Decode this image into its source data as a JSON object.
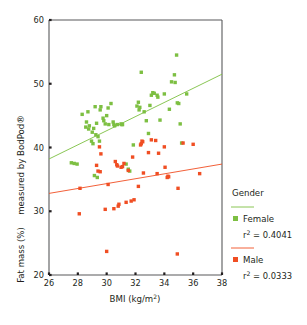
{
  "chart_data": {
    "type": "scatter",
    "title": "",
    "xlabel": "BMI (kg/m2)",
    "xlabel_base": "BMI (kg/m",
    "xlabel_sup": "2",
    "xlabel_tail": ")",
    "ylabel_line1": "measured by BodPod®",
    "ylabel_line2": "Fat mass (%)",
    "xlim": [
      26,
      38
    ],
    "ylim": [
      20,
      60
    ],
    "xticks": [
      26,
      28,
      30,
      32,
      34,
      36,
      38
    ],
    "xticklabels": [
      "26",
      "28",
      "30",
      "32",
      "34",
      "36",
      "38"
    ],
    "yticks": [
      20,
      30,
      40,
      50,
      60
    ],
    "yticklabels": [
      "20",
      "30",
      "40",
      "50",
      "60"
    ],
    "grid": false,
    "legend_position": "right",
    "colors": {
      "female": "#7DBF42",
      "male": "#F04E23",
      "axis": "#58595b",
      "text": "#231f20"
    },
    "series": [
      {
        "name": "Female",
        "color": "#7DBF42",
        "marker": "square",
        "r2": 0.4041,
        "r2_label": "r2 = 0.4041",
        "trendline": {
          "x0": 26,
          "y0": 38.2,
          "x1": 38,
          "y1": 51.5
        },
        "points": [
          [
            27.55,
            37.6
          ],
          [
            27.75,
            37.5
          ],
          [
            27.95,
            37.4
          ],
          [
            28.3,
            45.2
          ],
          [
            28.55,
            43.2
          ],
          [
            28.6,
            44.0
          ],
          [
            28.7,
            45.6
          ],
          [
            28.75,
            42.9
          ],
          [
            28.8,
            43.4
          ],
          [
            28.95,
            41.0
          ],
          [
            29.0,
            42.4
          ],
          [
            29.05,
            40.6
          ],
          [
            29.1,
            43.0
          ],
          [
            29.15,
            35.6
          ],
          [
            29.2,
            46.4
          ],
          [
            29.25,
            42.0
          ],
          [
            29.3,
            43.8
          ],
          [
            29.35,
            35.3
          ],
          [
            29.4,
            41.7
          ],
          [
            29.5,
            41.0
          ],
          [
            29.55,
            45.9
          ],
          [
            29.6,
            46.4
          ],
          [
            29.75,
            44.6
          ],
          [
            29.8,
            44.2
          ],
          [
            29.9,
            43.7
          ],
          [
            30.0,
            45.0
          ],
          [
            30.1,
            46.2
          ],
          [
            30.15,
            43.6
          ],
          [
            30.3,
            46.9
          ],
          [
            30.45,
            44.0
          ],
          [
            30.5,
            43.6
          ],
          [
            30.55,
            43.4
          ],
          [
            30.75,
            43.6
          ],
          [
            31.0,
            43.7
          ],
          [
            31.05,
            43.6
          ],
          [
            31.1,
            43.6
          ],
          [
            31.35,
            37.4
          ],
          [
            31.5,
            36.6
          ],
          [
            31.6,
            36.3
          ],
          [
            31.85,
            40.4
          ],
          [
            32.1,
            46.5
          ],
          [
            32.2,
            47.1
          ],
          [
            32.25,
            45.9
          ],
          [
            32.3,
            46.3
          ],
          [
            32.4,
            51.8
          ],
          [
            32.6,
            45.6
          ],
          [
            32.75,
            44.2
          ],
          [
            32.9,
            42.2
          ],
          [
            33.0,
            46.6
          ],
          [
            33.1,
            48.2
          ],
          [
            33.2,
            48.6
          ],
          [
            33.3,
            48.5
          ],
          [
            33.5,
            48.2
          ],
          [
            33.55,
            47.9
          ],
          [
            33.7,
            44.3
          ],
          [
            34.0,
            48.4
          ],
          [
            34.35,
            46.0
          ],
          [
            34.5,
            50.3
          ],
          [
            34.7,
            51.4
          ],
          [
            34.75,
            50.2
          ],
          [
            34.85,
            54.5
          ],
          [
            34.9,
            47.0
          ],
          [
            35.0,
            46.9
          ],
          [
            35.1,
            43.7
          ],
          [
            35.2,
            40.7
          ],
          [
            35.55,
            48.4
          ]
        ]
      },
      {
        "name": "Male",
        "color": "#F04E23",
        "marker": "square",
        "r2": 0.0333,
        "r2_label": "r2 = 0.0333",
        "trendline": {
          "x0": 26,
          "y0": 32.8,
          "x1": 38,
          "y1": 37.4
        },
        "points": [
          [
            28.1,
            29.6
          ],
          [
            28.15,
            33.6
          ],
          [
            29.3,
            37.2
          ],
          [
            29.4,
            36.3
          ],
          [
            29.5,
            40.1
          ],
          [
            29.55,
            36.2
          ],
          [
            29.6,
            39.0
          ],
          [
            29.9,
            30.3
          ],
          [
            30.0,
            23.7
          ],
          [
            30.1,
            34.2
          ],
          [
            30.5,
            30.4
          ],
          [
            30.6,
            37.8
          ],
          [
            30.7,
            37.3
          ],
          [
            30.75,
            37.1
          ],
          [
            30.8,
            30.8
          ],
          [
            30.85,
            31.1
          ],
          [
            31.0,
            36.9
          ],
          [
            31.1,
            37.0
          ],
          [
            31.2,
            37.5
          ],
          [
            31.35,
            31.4
          ],
          [
            31.5,
            36.4
          ],
          [
            31.7,
            31.6
          ],
          [
            31.8,
            38.5
          ],
          [
            31.9,
            31.8
          ],
          [
            32.2,
            33.9
          ],
          [
            32.35,
            40.4
          ],
          [
            32.4,
            40.6
          ],
          [
            32.45,
            41.0
          ],
          [
            32.5,
            40.9
          ],
          [
            32.55,
            36.0
          ],
          [
            32.9,
            39.2
          ],
          [
            33.1,
            41.2
          ],
          [
            33.4,
            41.1
          ],
          [
            33.5,
            35.9
          ],
          [
            33.6,
            39.1
          ],
          [
            34.0,
            40.1
          ],
          [
            34.05,
            36.9
          ],
          [
            34.2,
            35.3
          ],
          [
            34.25,
            35.5
          ],
          [
            34.3,
            35.4
          ],
          [
            34.9,
            23.3
          ],
          [
            34.95,
            33.6
          ],
          [
            35.3,
            40.7
          ],
          [
            36.0,
            40.5
          ],
          [
            36.45,
            35.9
          ]
        ]
      }
    ]
  },
  "legend": {
    "title": "Gender",
    "entries": [
      {
        "label": "Female",
        "r2_prefix": "r",
        "r2_sup": "2",
        "r2_value": "= 0.4041",
        "color": "#7DBF42"
      },
      {
        "label": "Male",
        "r2_prefix": "r",
        "r2_sup": "2",
        "r2_value": "= 0.0333",
        "color": "#F04E23"
      }
    ]
  }
}
